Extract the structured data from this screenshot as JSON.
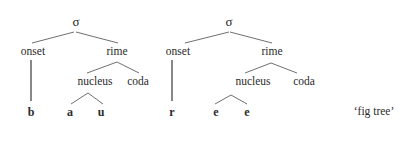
{
  "figure": {
    "gloss": "‘fig tree’",
    "trees": [
      {
        "root": "σ",
        "onset_label": "onset",
        "rime_label": "rime",
        "nucleus_label": "nucleus",
        "coda_label": "coda",
        "onset_segments": [
          "b"
        ],
        "nucleus_segments": [
          "a",
          "u"
        ],
        "coda_segments": []
      },
      {
        "root": "σ",
        "onset_label": "onset",
        "rime_label": "rime",
        "nucleus_label": "nucleus",
        "coda_label": "coda",
        "onset_segments": [
          "r"
        ],
        "nucleus_segments": [
          "e",
          "e"
        ],
        "coda_segments": []
      }
    ]
  },
  "colors": {
    "line": "#6f6f6f",
    "text": "#2a2a2a",
    "background": "#ffffff"
  }
}
